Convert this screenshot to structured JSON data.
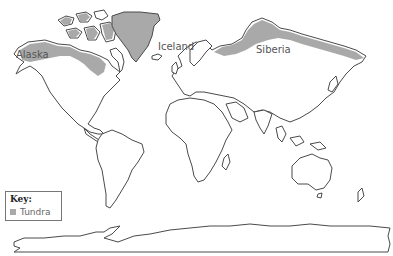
{
  "map": {
    "title": "World map showing tundra regions",
    "colors": {
      "tundra": "#a9a9a9",
      "outline": "#4a4a4a",
      "land": "#ffffff"
    },
    "labels": [
      {
        "id": "alaska",
        "text": "Alaska"
      },
      {
        "id": "iceland",
        "text": "Iceland"
      },
      {
        "id": "siberia",
        "text": "Siberia"
      }
    ]
  },
  "key": {
    "title": "Key:",
    "items": [
      {
        "label": "Tundra",
        "color": "#a9a9a9"
      }
    ]
  }
}
